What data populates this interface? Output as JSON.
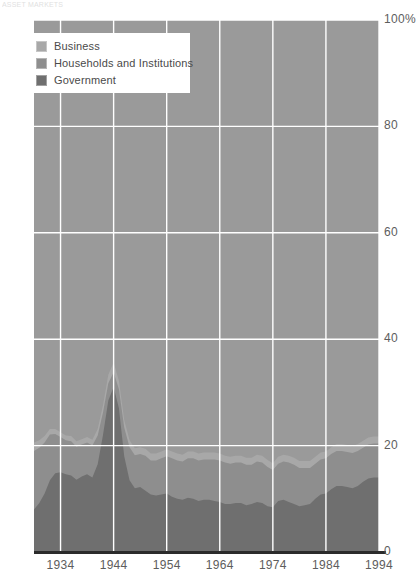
{
  "header": {
    "cut_text": "ASSET MARKETS"
  },
  "legend": {
    "position": "top-left",
    "items": [
      {
        "label": "Business",
        "color": "#a8a8a8",
        "key": "business"
      },
      {
        "label": "Households and Institutions",
        "color": "#8e8e8e",
        "key": "households"
      },
      {
        "label": "Government",
        "color": "#6f6f6f",
        "key": "government"
      }
    ]
  },
  "chart_data": {
    "type": "area",
    "stacked": true,
    "title": "",
    "subtitle": "",
    "xlabel": "",
    "ylabel": "",
    "xlim": [
      1929,
      1994
    ],
    "ylim": [
      0,
      100
    ],
    "yticks": [
      0,
      20,
      40,
      60,
      80,
      100
    ],
    "ytick_labels": [
      "0",
      "20",
      "40",
      "60",
      "80",
      "100%"
    ],
    "xticks": [
      1934,
      1944,
      1954,
      1964,
      1974,
      1984,
      1994
    ],
    "xtick_labels": [
      "1934",
      "1944",
      "1954",
      "1964",
      "1974",
      "1984",
      "1994"
    ],
    "grid": true,
    "grid_color": "#ffffff",
    "plot_background": "#9a9a9a",
    "legend_position": "top-left",
    "x": [
      1929,
      1930,
      1931,
      1932,
      1933,
      1934,
      1935,
      1936,
      1937,
      1938,
      1939,
      1940,
      1941,
      1942,
      1943,
      1944,
      1945,
      1946,
      1947,
      1948,
      1949,
      1950,
      1951,
      1952,
      1953,
      1954,
      1955,
      1956,
      1957,
      1958,
      1959,
      1960,
      1961,
      1962,
      1963,
      1964,
      1965,
      1966,
      1967,
      1968,
      1969,
      1970,
      1971,
      1972,
      1973,
      1974,
      1975,
      1976,
      1977,
      1978,
      1979,
      1980,
      1981,
      1982,
      1983,
      1984,
      1985,
      1986,
      1987,
      1988,
      1989,
      1990,
      1991,
      1992,
      1993,
      1994
    ],
    "series": [
      {
        "name": "Government",
        "color": "#6f6f6f",
        "values": [
          8.0,
          9.2,
          11.0,
          13.5,
          14.8,
          15.0,
          14.6,
          14.4,
          13.6,
          14.2,
          14.6,
          14.0,
          16.5,
          22.0,
          28.5,
          31.0,
          27.0,
          18.0,
          13.5,
          12.0,
          12.2,
          11.5,
          10.8,
          10.6,
          10.8,
          11.0,
          10.4,
          10.0,
          9.8,
          10.2,
          10.0,
          9.6,
          9.8,
          9.8,
          9.6,
          9.4,
          9.0,
          9.0,
          9.2,
          9.2,
          8.8,
          9.0,
          9.4,
          9.2,
          8.6,
          8.4,
          9.6,
          9.8,
          9.4,
          9.0,
          8.6,
          8.8,
          9.0,
          10.0,
          10.8,
          11.0,
          11.8,
          12.4,
          12.4,
          12.2,
          12.0,
          12.4,
          13.2,
          13.8,
          14.0,
          14.0
        ]
      },
      {
        "name": "Households and Institutions",
        "color": "#8e8e8e",
        "values": [
          11.0,
          10.4,
          9.6,
          8.6,
          7.4,
          6.6,
          6.4,
          6.4,
          6.2,
          6.0,
          6.0,
          6.0,
          5.4,
          4.2,
          3.2,
          2.8,
          3.6,
          5.4,
          6.2,
          6.2,
          6.2,
          6.6,
          6.4,
          6.6,
          6.8,
          7.0,
          7.2,
          7.2,
          7.2,
          7.4,
          7.6,
          7.6,
          7.6,
          7.6,
          7.8,
          7.8,
          7.8,
          7.6,
          7.6,
          7.6,
          7.6,
          7.4,
          7.6,
          7.6,
          7.4,
          7.0,
          7.0,
          7.2,
          7.4,
          7.4,
          7.2,
          7.0,
          6.8,
          6.6,
          6.6,
          6.6,
          6.6,
          6.6,
          6.6,
          6.6,
          6.6,
          6.6,
          6.4,
          6.4,
          6.4,
          6.4
        ]
      },
      {
        "name": "Business",
        "color": "#a8a8a8",
        "values": [
          1.6,
          1.4,
          1.2,
          1.0,
          0.9,
          0.9,
          0.9,
          1.0,
          1.0,
          1.0,
          1.0,
          1.1,
          1.2,
          1.4,
          1.6,
          1.8,
          1.6,
          1.4,
          1.3,
          1.3,
          1.3,
          1.3,
          1.3,
          1.3,
          1.3,
          1.3,
          1.3,
          1.3,
          1.3,
          1.3,
          1.3,
          1.3,
          1.3,
          1.3,
          1.3,
          1.3,
          1.3,
          1.3,
          1.3,
          1.3,
          1.3,
          1.3,
          1.3,
          1.3,
          1.3,
          1.3,
          1.3,
          1.3,
          1.3,
          1.3,
          1.3,
          1.3,
          1.3,
          1.3,
          1.3,
          1.3,
          1.3,
          1.3,
          1.3,
          1.3,
          1.3,
          1.3,
          1.3,
          1.3,
          1.3,
          1.3
        ]
      }
    ]
  }
}
